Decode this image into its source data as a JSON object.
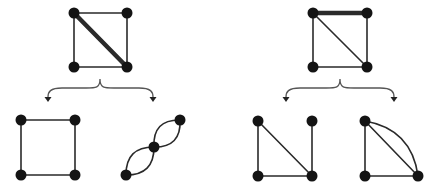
{
  "diagram": {
    "colors": {
      "edge": "#2a2a2a",
      "node": "#141414",
      "brace": "#555555",
      "background": "#ffffff"
    },
    "node_radius": 5.5,
    "graphs": [
      {
        "id": "left-original",
        "nodes": [
          [
            74,
            13
          ],
          [
            127,
            13
          ],
          [
            74,
            67
          ],
          [
            127,
            67
          ]
        ],
        "edges": [
          {
            "from": 0,
            "to": 1,
            "type": "line",
            "weight": "thin"
          },
          {
            "from": 1,
            "to": 3,
            "type": "line",
            "weight": "thin"
          },
          {
            "from": 2,
            "to": 3,
            "type": "line",
            "weight": "thin"
          },
          {
            "from": 0,
            "to": 2,
            "type": "line",
            "weight": "thin"
          },
          {
            "from": 0,
            "to": 3,
            "type": "line",
            "weight": "thick"
          }
        ]
      },
      {
        "id": "right-original",
        "nodes": [
          [
            313,
            13
          ],
          [
            367,
            13
          ],
          [
            313,
            67
          ],
          [
            367,
            67
          ]
        ],
        "edges": [
          {
            "from": 0,
            "to": 1,
            "type": "line",
            "weight": "thick"
          },
          {
            "from": 1,
            "to": 3,
            "type": "line",
            "weight": "thin"
          },
          {
            "from": 2,
            "to": 3,
            "type": "line",
            "weight": "thin"
          },
          {
            "from": 0,
            "to": 2,
            "type": "line",
            "weight": "thin"
          },
          {
            "from": 0,
            "to": 3,
            "type": "line",
            "weight": "thin"
          }
        ]
      },
      {
        "id": "left-deletion",
        "nodes": [
          [
            21,
            120
          ],
          [
            75,
            120
          ],
          [
            21,
            175
          ],
          [
            75,
            175
          ]
        ],
        "edges": [
          {
            "from": 0,
            "to": 1,
            "type": "line",
            "weight": "thin"
          },
          {
            "from": 1,
            "to": 3,
            "type": "line",
            "weight": "thin"
          },
          {
            "from": 2,
            "to": 3,
            "type": "line",
            "weight": "thin"
          },
          {
            "from": 0,
            "to": 2,
            "type": "line",
            "weight": "thin"
          }
        ]
      },
      {
        "id": "left-contraction",
        "nodes": [
          [
            126,
            175
          ],
          [
            154,
            147
          ],
          [
            180,
            120
          ]
        ],
        "edges": [
          {
            "from": 0,
            "to": 1,
            "type": "arc",
            "bend": 10
          },
          {
            "from": 0,
            "to": 1,
            "type": "arc",
            "bend": -10
          },
          {
            "from": 1,
            "to": 2,
            "type": "arc",
            "bend": 10
          },
          {
            "from": 1,
            "to": 2,
            "type": "arc",
            "bend": -10
          }
        ]
      },
      {
        "id": "right-deletion",
        "nodes": [
          [
            258,
            121
          ],
          [
            312,
            121
          ],
          [
            258,
            176
          ],
          [
            312,
            176
          ]
        ],
        "edges": [
          {
            "from": 0,
            "to": 2,
            "type": "line",
            "weight": "thin"
          },
          {
            "from": 2,
            "to": 3,
            "type": "line",
            "weight": "thin"
          },
          {
            "from": 0,
            "to": 3,
            "type": "line",
            "weight": "thin"
          },
          {
            "from": 1,
            "to": 3,
            "type": "line",
            "weight": "thin"
          }
        ]
      },
      {
        "id": "right-contraction",
        "nodes": [
          [
            365,
            121
          ],
          [
            365,
            176
          ],
          [
            418,
            176
          ]
        ],
        "edges": [
          {
            "from": 0,
            "to": 1,
            "type": "line",
            "weight": "thin"
          },
          {
            "from": 1,
            "to": 2,
            "type": "line",
            "weight": "thin"
          },
          {
            "from": 0,
            "to": 2,
            "type": "line",
            "weight": "thin"
          },
          {
            "from": 0,
            "to": 2,
            "type": "arc",
            "bend": -14
          }
        ]
      }
    ],
    "braces": [
      {
        "id": "left-brace",
        "peak": [
          100,
          79
        ],
        "left_end": [
          48,
          101
        ],
        "right_end": [
          153,
          101
        ]
      },
      {
        "id": "right-brace",
        "peak": [
          340,
          79
        ],
        "left_end": [
          286,
          101
        ],
        "right_end": [
          394,
          101
        ]
      }
    ]
  }
}
